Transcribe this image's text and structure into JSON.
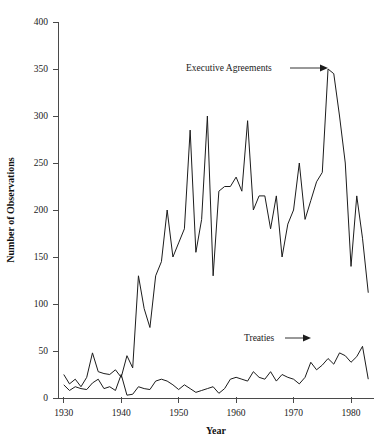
{
  "figure": {
    "caption": "",
    "background": "#ffffff",
    "line_color": "#1c1c1c",
    "axis_color": "#4a4a4a"
  },
  "annotations": {
    "executive_agreements": {
      "label": "Executive Agreements",
      "arrow": "arrow-right",
      "points_to_year": 1976
    },
    "treaties": {
      "label": "Treaties",
      "arrow": "arrow-right",
      "points_to_year": 1972
    }
  },
  "chart_data": {
    "type": "line",
    "title": "",
    "subtitle": "",
    "xlabel": "Year",
    "ylabel": "Number of Observations",
    "xlim": [
      1929,
      1984
    ],
    "ylim": [
      0,
      400
    ],
    "xticks": [
      1930,
      1940,
      1950,
      1960,
      1970,
      1980
    ],
    "yticks": [
      0,
      50,
      100,
      150,
      200,
      250,
      300,
      350,
      400
    ],
    "xtick_labels": [
      "1930",
      "1940",
      "1950",
      "1960",
      "1970",
      "1980"
    ],
    "ytick_labels": [
      "0",
      "50",
      "100",
      "150",
      "200",
      "250",
      "300",
      "350",
      "400"
    ],
    "grid": false,
    "legend": "annotated-inline",
    "x": [
      1930,
      1931,
      1932,
      1933,
      1934,
      1935,
      1936,
      1937,
      1938,
      1939,
      1940,
      1941,
      1942,
      1943,
      1944,
      1945,
      1946,
      1947,
      1948,
      1949,
      1950,
      1951,
      1952,
      1953,
      1954,
      1955,
      1956,
      1957,
      1958,
      1959,
      1960,
      1961,
      1962,
      1963,
      1964,
      1965,
      1966,
      1967,
      1968,
      1969,
      1970,
      1971,
      1972,
      1973,
      1974,
      1975,
      1976,
      1977,
      1978,
      1979,
      1980,
      1981,
      1982,
      1983
    ],
    "series": [
      {
        "name": "Executive Agreements",
        "values": [
          25,
          15,
          20,
          12,
          22,
          48,
          28,
          26,
          25,
          30,
          22,
          45,
          32,
          130,
          95,
          75,
          130,
          145,
          200,
          150,
          165,
          180,
          285,
          155,
          190,
          300,
          130,
          220,
          225,
          225,
          235,
          220,
          295,
          200,
          215,
          215,
          180,
          215,
          150,
          185,
          200,
          250,
          190,
          210,
          230,
          240,
          350,
          345,
          300,
          250,
          140,
          215,
          170,
          112
        ]
      },
      {
        "name": "Treaties",
        "values": [
          14,
          8,
          12,
          10,
          9,
          16,
          20,
          10,
          12,
          8,
          25,
          3,
          4,
          12,
          10,
          9,
          18,
          20,
          18,
          14,
          9,
          14,
          10,
          6,
          8,
          10,
          12,
          5,
          10,
          20,
          22,
          20,
          18,
          28,
          22,
          20,
          28,
          18,
          25,
          22,
          20,
          15,
          22,
          38,
          30,
          35,
          42,
          36,
          48,
          45,
          38,
          44,
          55,
          20
        ]
      }
    ]
  }
}
